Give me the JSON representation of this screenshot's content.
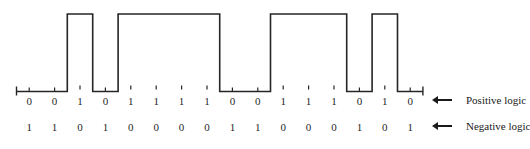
{
  "figure": {
    "stroke_color": "#262626",
    "background_color": "#ffffff",
    "bit_count": 16
  },
  "chart_data": {
    "type": "line",
    "title": "",
    "xlabel": "",
    "ylabel": "",
    "waveform": "square",
    "x": [
      0,
      1,
      2,
      3,
      4,
      5,
      6,
      7,
      8,
      9,
      10,
      11,
      12,
      13,
      14,
      15
    ],
    "values": [
      0,
      0,
      1,
      0,
      1,
      1,
      1,
      1,
      0,
      0,
      1,
      1,
      1,
      0,
      1,
      0
    ],
    "ylim": [
      0,
      1
    ],
    "grid": false,
    "legend_position": "right",
    "series": [
      {
        "name": "Positive logic",
        "values": [
          0,
          0,
          1,
          0,
          1,
          1,
          1,
          1,
          0,
          0,
          1,
          1,
          1,
          0,
          1,
          0
        ]
      },
      {
        "name": "Negative logic",
        "values": [
          1,
          1,
          0,
          1,
          0,
          0,
          0,
          0,
          1,
          1,
          0,
          0,
          0,
          1,
          0,
          1
        ]
      }
    ]
  },
  "rows": {
    "positive": {
      "label": "Positive logic",
      "bits": [
        "0",
        "0",
        "1",
        "0",
        "1",
        "1",
        "1",
        "1",
        "0",
        "0",
        "1",
        "1",
        "1",
        "0",
        "1",
        "0"
      ]
    },
    "negative": {
      "label": "Negative logic",
      "bits": [
        "1",
        "1",
        "0",
        "1",
        "0",
        "0",
        "0",
        "0",
        "1",
        "1",
        "0",
        "0",
        "0",
        "1",
        "0",
        "1"
      ]
    }
  },
  "legend": [
    {
      "arrow": "left-arrow-icon",
      "label": "Positive logic"
    },
    {
      "arrow": "left-arrow-icon",
      "label": "Negative logic"
    }
  ]
}
